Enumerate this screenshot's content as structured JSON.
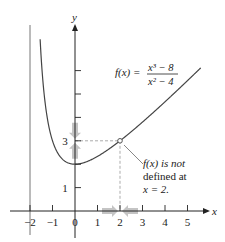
{
  "chart_data": {
    "type": "line",
    "title": "",
    "function_label": {
      "lhs": "f(x) =",
      "numerator": "x³ − 8",
      "denominator": "x² − 4"
    },
    "xlabel": "x",
    "ylabel": "y",
    "xlim": [
      -2.5,
      5.9
    ],
    "ylim": [
      -1.3,
      8.8
    ],
    "x_ticks": [
      -2,
      -1,
      0,
      1,
      2,
      3,
      4,
      5
    ],
    "x_tick_labels": [
      "−2",
      "−1",
      "0",
      "1",
      "2",
      "3",
      "4",
      "5"
    ],
    "y_ticks": [
      1,
      2,
      3,
      4,
      5,
      6
    ],
    "y_tick_labels": {
      "1": "1",
      "3": "3"
    },
    "vertical_asymptote": -2,
    "series": [
      {
        "name": "f(x) = (x^3 - 8)/(x^2 - 4)",
        "formula_simplified": "(x^2 + 2x + 4)/(x + 2)",
        "domain": [
          -1.55,
          5.6
        ],
        "excluded_point": {
          "x": 2,
          "y": 3
        }
      }
    ],
    "annotations": [
      {
        "lines": [
          "f(x) is not",
          "defined at",
          "x = 2."
        ],
        "points_to": {
          "x": 2,
          "y": 3
        }
      }
    ],
    "limit_arrows": {
      "x_axis_toward": 2,
      "y_axis_toward": 3
    },
    "grid": false,
    "colors": {
      "axes": "#222222",
      "curve": "#444444",
      "dashed": "#888888",
      "arrows": "#b0b0b0"
    }
  }
}
